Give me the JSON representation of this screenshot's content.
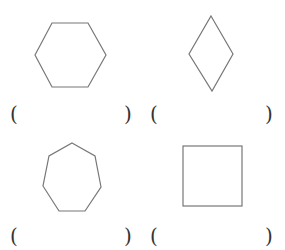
{
  "worksheet": {
    "items": [
      {
        "shape": "hexagon",
        "answer_open": "(",
        "answer_close": ")"
      },
      {
        "shape": "rhombus",
        "answer_open": "(",
        "answer_close": ")"
      },
      {
        "shape": "heptagon",
        "answer_open": "(",
        "answer_close": ")"
      },
      {
        "shape": "square",
        "answer_open": "(",
        "answer_close": ")"
      }
    ],
    "stroke_color": "#777777"
  }
}
